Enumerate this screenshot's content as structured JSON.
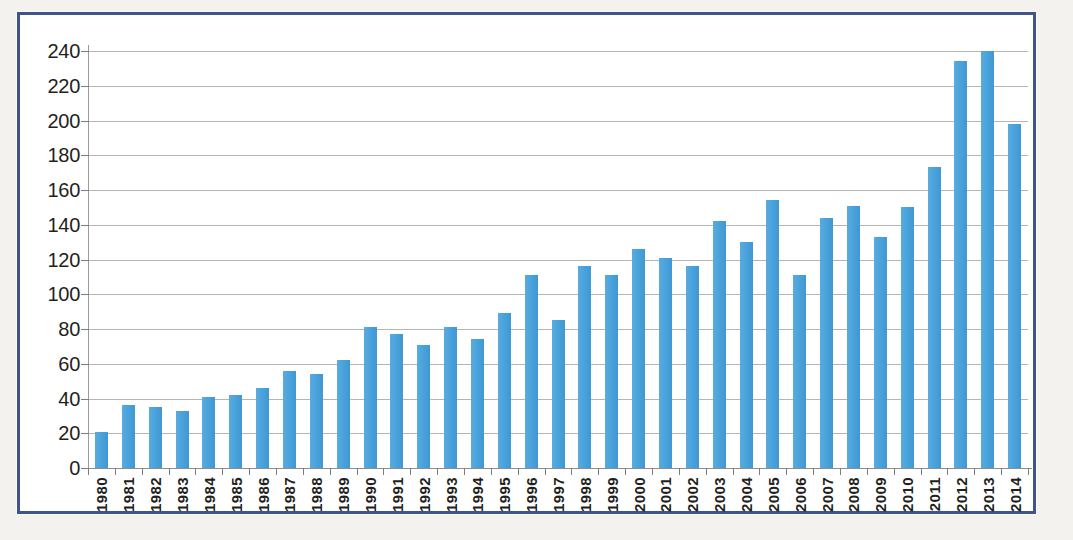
{
  "figure": {
    "border_color": "#3f5488",
    "plot_background": "#ffffff",
    "page_background": "#f4f2ee"
  },
  "chart_data": {
    "type": "bar",
    "title": "",
    "subtitle": "",
    "xlabel": "",
    "ylabel": "",
    "bar_color": "#4da5dd",
    "grid": true,
    "legend": "none",
    "ylim": [
      0,
      240
    ],
    "ytick_step": 20,
    "ytick_labels": [
      "240",
      "220",
      "200",
      "180",
      "160",
      "140",
      "120",
      "100",
      "80",
      "60",
      "40",
      "20",
      "0"
    ],
    "ytick_values": [
      240,
      220,
      200,
      180,
      160,
      140,
      120,
      100,
      80,
      60,
      40,
      20,
      0
    ],
    "categories": [
      "1980",
      "1981",
      "1982",
      "1983",
      "1984",
      "1985",
      "1986",
      "1987",
      "1988",
      "1989",
      "1990",
      "1991",
      "1992",
      "1993",
      "1994",
      "1995",
      "1996",
      "1997",
      "1998",
      "1999",
      "2000",
      "2001",
      "2002",
      "2003",
      "2004",
      "2005",
      "2006",
      "2007",
      "2008",
      "2009",
      "2010",
      "2011",
      "2012",
      "2013",
      "2014"
    ],
    "values": [
      21,
      36,
      35,
      33,
      41,
      42,
      46,
      56,
      54,
      62,
      81,
      77,
      71,
      81,
      74,
      89,
      111,
      85,
      116,
      111,
      126,
      121,
      116,
      142,
      130,
      154,
      111,
      144,
      151,
      133,
      150,
      173,
      234,
      240,
      198
    ]
  }
}
